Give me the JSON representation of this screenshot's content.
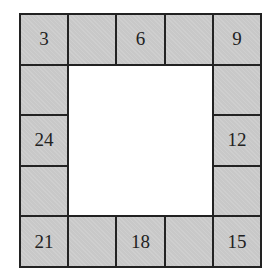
{
  "grid": {
    "rows": 5,
    "cols": 5,
    "cells": [
      [
        "3",
        "",
        "6",
        "",
        "9"
      ],
      [
        "",
        null,
        null,
        null,
        ""
      ],
      [
        "24",
        null,
        null,
        null,
        "12"
      ],
      [
        "",
        null,
        null,
        null,
        ""
      ],
      [
        "21",
        "",
        "18",
        "",
        "15"
      ]
    ]
  },
  "colors": {
    "cell_fill": "#c8c8c8",
    "border": "#222222",
    "background": "#ffffff"
  }
}
